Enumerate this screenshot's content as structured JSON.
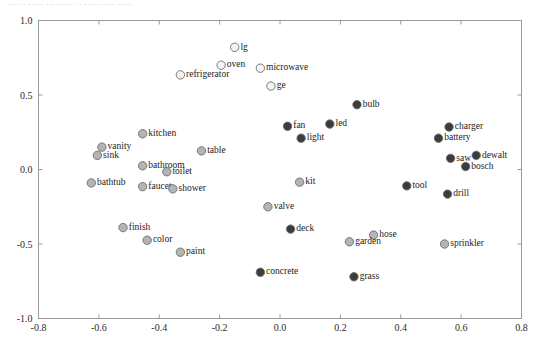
{
  "caption": {
    "text": "··· ·· ····· ········· ·· ·········· ·····"
  },
  "chart_data": {
    "type": "scatter",
    "title": "",
    "subtitle": "",
    "xlabel": "",
    "ylabel": "",
    "xlim": [
      -0.8,
      0.8
    ],
    "ylim": [
      -1.0,
      1.0
    ],
    "xticks": [
      "-0.8",
      "-0.6",
      "-0.4",
      "-0.2",
      "0.0",
      "0.2",
      "0.4",
      "0.6",
      "0.8"
    ],
    "xtickvalues": [
      -0.8,
      -0.6,
      -0.4,
      -0.2,
      0.0,
      0.2,
      0.4,
      0.6,
      0.8
    ],
    "yticks": [
      "-1.0",
      "-0.5",
      "0.0",
      "0.5",
      "1.0"
    ],
    "ytickvalues": [
      -1.0,
      -0.5,
      0.0,
      0.5,
      1.0
    ],
    "grid": false,
    "legend": "none",
    "marker_shades": {
      "hollow": "#f4f4f4",
      "light": "#b4b4b4",
      "medium": "#9a9a9a",
      "dark": "#3c3c3c"
    },
    "marker_outline": "#6d6d6d",
    "marker_radius": 4.2,
    "points": [
      {
        "label": "lg",
        "x": -0.15,
        "y": 0.82,
        "shade": "hollow",
        "label_side": "right"
      },
      {
        "label": "oven",
        "x": -0.195,
        "y": 0.7,
        "shade": "hollow",
        "label_side": "right"
      },
      {
        "label": "microwave",
        "x": -0.065,
        "y": 0.68,
        "shade": "hollow",
        "label_side": "right"
      },
      {
        "label": "refrigerator",
        "x": -0.33,
        "y": 0.635,
        "shade": "hollow",
        "label_side": "right"
      },
      {
        "label": "ge",
        "x": -0.03,
        "y": 0.56,
        "shade": "hollow",
        "label_side": "right"
      },
      {
        "label": "bulb",
        "x": 0.255,
        "y": 0.435,
        "shade": "dark",
        "label_side": "right"
      },
      {
        "label": "charger",
        "x": 0.56,
        "y": 0.285,
        "shade": "dark",
        "label_side": "right"
      },
      {
        "label": "led",
        "x": 0.165,
        "y": 0.305,
        "shade": "dark",
        "label_side": "right"
      },
      {
        "label": "fan",
        "x": 0.025,
        "y": 0.29,
        "shade": "dark",
        "label_side": "right"
      },
      {
        "label": "kitchen",
        "x": -0.455,
        "y": 0.24,
        "shade": "light",
        "label_side": "right"
      },
      {
        "label": "light",
        "x": 0.07,
        "y": 0.21,
        "shade": "dark",
        "label_side": "right"
      },
      {
        "label": "battery",
        "x": 0.525,
        "y": 0.21,
        "shade": "dark",
        "label_side": "right"
      },
      {
        "label": "vanity",
        "x": -0.59,
        "y": 0.15,
        "shade": "light",
        "label_side": "right"
      },
      {
        "label": "table",
        "x": -0.26,
        "y": 0.125,
        "shade": "light",
        "label_side": "right"
      },
      {
        "label": "sink",
        "x": -0.605,
        "y": 0.095,
        "shade": "light",
        "label_side": "right"
      },
      {
        "label": "dewalt",
        "x": 0.65,
        "y": 0.095,
        "shade": "dark",
        "label_side": "right"
      },
      {
        "label": "saw",
        "x": 0.565,
        "y": 0.075,
        "shade": "dark",
        "label_side": "right"
      },
      {
        "label": "bathroom",
        "x": -0.455,
        "y": 0.025,
        "shade": "light",
        "label_side": "right"
      },
      {
        "label": "bosch",
        "x": 0.615,
        "y": 0.02,
        "shade": "dark",
        "label_side": "right"
      },
      {
        "label": "toilet",
        "x": -0.375,
        "y": -0.015,
        "shade": "light",
        "label_side": "right"
      },
      {
        "label": "bathtub",
        "x": -0.625,
        "y": -0.09,
        "shade": "light",
        "label_side": "right"
      },
      {
        "label": "kit",
        "x": 0.065,
        "y": -0.085,
        "shade": "light",
        "label_side": "right"
      },
      {
        "label": "faucet",
        "x": -0.455,
        "y": -0.115,
        "shade": "light",
        "label_side": "right"
      },
      {
        "label": "shower",
        "x": -0.355,
        "y": -0.13,
        "shade": "light",
        "label_side": "right"
      },
      {
        "label": "tool",
        "x": 0.42,
        "y": -0.11,
        "shade": "dark",
        "label_side": "right"
      },
      {
        "label": "drill",
        "x": 0.555,
        "y": -0.165,
        "shade": "dark",
        "label_side": "right"
      },
      {
        "label": "valve",
        "x": -0.04,
        "y": -0.25,
        "shade": "light",
        "label_side": "right"
      },
      {
        "label": "finish",
        "x": -0.52,
        "y": -0.39,
        "shade": "light",
        "label_side": "right"
      },
      {
        "label": "deck",
        "x": 0.035,
        "y": -0.4,
        "shade": "dark",
        "label_side": "right"
      },
      {
        "label": "hose",
        "x": 0.31,
        "y": -0.44,
        "shade": "light",
        "label_side": "right"
      },
      {
        "label": "color",
        "x": -0.44,
        "y": -0.475,
        "shade": "light",
        "label_side": "right"
      },
      {
        "label": "garden",
        "x": 0.23,
        "y": -0.485,
        "shade": "light",
        "label_side": "right"
      },
      {
        "label": "sprinkler",
        "x": 0.545,
        "y": -0.5,
        "shade": "light",
        "label_side": "right"
      },
      {
        "label": "paint",
        "x": -0.33,
        "y": -0.555,
        "shade": "light",
        "label_side": "right"
      },
      {
        "label": "concrete",
        "x": -0.065,
        "y": -0.69,
        "shade": "dark",
        "label_side": "right"
      },
      {
        "label": "grass",
        "x": 0.245,
        "y": -0.72,
        "shade": "dark",
        "label_side": "right"
      }
    ]
  }
}
